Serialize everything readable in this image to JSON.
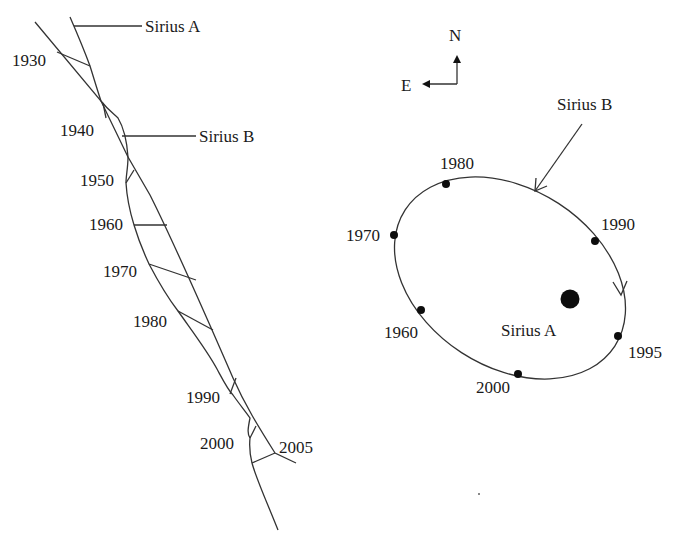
{
  "left_panel": {
    "title_hint": "Proper motion paths across the sky",
    "labels": {
      "sirius_a": "Sirius A",
      "sirius_b": "Sirius B"
    },
    "years": [
      "1930",
      "1940",
      "1950",
      "1960",
      "1970",
      "1980",
      "1990",
      "2000",
      "2005"
    ]
  },
  "compass": {
    "north": "N",
    "east": "E"
  },
  "right_panel": {
    "labels": {
      "sirius_b": "Sirius B",
      "sirius_a": "Sirius A"
    },
    "orbit_points": [
      {
        "year": "1960"
      },
      {
        "year": "1970"
      },
      {
        "year": "1980"
      },
      {
        "year": "1990"
      },
      {
        "year": "1995"
      },
      {
        "year": "2000"
      }
    ]
  },
  "colors": {
    "line": "#333333",
    "dot": "#0d0d0d",
    "background": "#ffffff"
  }
}
